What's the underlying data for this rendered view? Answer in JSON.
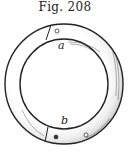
{
  "figure": {
    "title": "Fig. 208",
    "labels": {
      "a": "a",
      "b": "b"
    },
    "caption_truncated": true,
    "colors": {
      "ink": "#222222",
      "background": "#ffffff",
      "ring_fill": "#f2f2f2"
    }
  }
}
